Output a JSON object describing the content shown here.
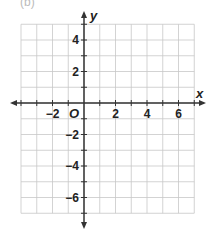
{
  "partial_label": "(b)",
  "plane": {
    "x_axis_label": "x",
    "y_axis_label": "y",
    "origin_label": "O",
    "x_range": [
      -4,
      7
    ],
    "y_range": [
      -7,
      5
    ],
    "grid_step": 1,
    "x_tick_labels": [
      {
        "value": -2,
        "text": "−2"
      },
      {
        "value": 2,
        "text": "2"
      },
      {
        "value": 4,
        "text": "4"
      },
      {
        "value": 6,
        "text": "6"
      }
    ],
    "y_tick_labels": [
      {
        "value": 4,
        "text": "4"
      },
      {
        "value": 2,
        "text": "2"
      },
      {
        "value": -2,
        "text": "−2"
      },
      {
        "value": -4,
        "text": "−4"
      },
      {
        "value": -6,
        "text": "−6"
      }
    ],
    "colors": {
      "grid": "#c8c8c8",
      "axis": "#333333"
    }
  }
}
